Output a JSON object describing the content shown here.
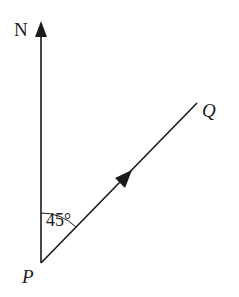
{
  "diagram": {
    "type": "bearing",
    "labels": {
      "north": "N",
      "origin": "P",
      "destination": "Q",
      "angle": "45°"
    },
    "angle_degrees": 45,
    "colors": {
      "stroke": "#1a1a1a",
      "background": "#ffffff"
    }
  }
}
